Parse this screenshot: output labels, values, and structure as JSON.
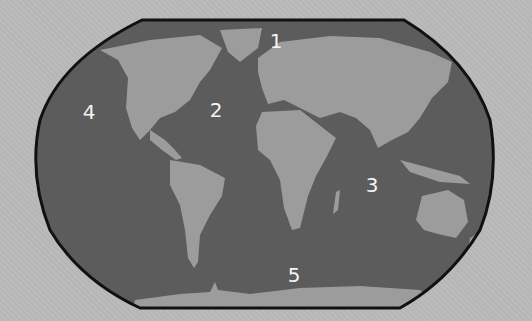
{
  "map": {
    "type": "world-oceans",
    "colors": {
      "background": "#b9b9b9",
      "ocean": "#5c5c5c",
      "land": "#9c9c9c",
      "border": "#111111",
      "label": "#f4f4f4"
    },
    "ocean_labels": [
      {
        "id": "1",
        "text": "1",
        "region": "arctic",
        "x": 276,
        "y": 41
      },
      {
        "id": "2",
        "text": "2",
        "region": "atlantic",
        "x": 216,
        "y": 110
      },
      {
        "id": "3",
        "text": "3",
        "region": "indian",
        "x": 372,
        "y": 185
      },
      {
        "id": "4",
        "text": "4",
        "region": "pacific",
        "x": 89,
        "y": 112
      },
      {
        "id": "5",
        "text": "5",
        "region": "southern",
        "x": 294,
        "y": 275
      }
    ]
  }
}
